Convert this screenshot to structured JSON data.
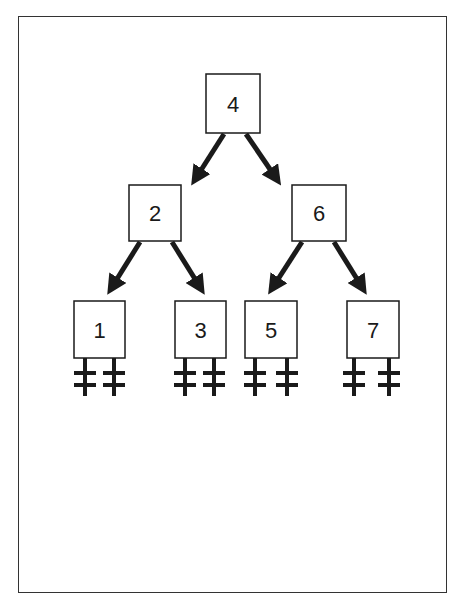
{
  "diagram": {
    "type": "binary-search-tree",
    "nodes": [
      {
        "id": "n4",
        "label": "4",
        "x": 206,
        "y": 74,
        "w": 54,
        "h": 59
      },
      {
        "id": "n2",
        "label": "2",
        "x": 129,
        "y": 185,
        "w": 52,
        "h": 56
      },
      {
        "id": "n6",
        "label": "6",
        "x": 292,
        "y": 185,
        "w": 54,
        "h": 56
      },
      {
        "id": "n1",
        "label": "1",
        "x": 74,
        "y": 301,
        "w": 51,
        "h": 57
      },
      {
        "id": "n3",
        "label": "3",
        "x": 175,
        "y": 301,
        "w": 51,
        "h": 57
      },
      {
        "id": "n5",
        "label": "5",
        "x": 245,
        "y": 301,
        "w": 52,
        "h": 57
      },
      {
        "id": "n7",
        "label": "7",
        "x": 347,
        "y": 301,
        "w": 52,
        "h": 57
      }
    ],
    "edges": [
      {
        "from": "4",
        "to": "2",
        "x1": 224,
        "y1": 134,
        "x2": 196,
        "y2": 178
      },
      {
        "from": "4",
        "to": "6",
        "x1": 246,
        "y1": 134,
        "x2": 276,
        "y2": 178
      },
      {
        "from": "2",
        "to": "1",
        "x1": 140,
        "y1": 242,
        "x2": 112,
        "y2": 287
      },
      {
        "from": "2",
        "to": "3",
        "x1": 172,
        "y1": 242,
        "x2": 200,
        "y2": 287
      },
      {
        "from": "6",
        "to": "5",
        "x1": 302,
        "y1": 242,
        "x2": 273,
        "y2": 287
      },
      {
        "from": "6",
        "to": "7",
        "x1": 334,
        "y1": 242,
        "x2": 362,
        "y2": 287
      }
    ],
    "null_pointers": [
      {
        "node": "1",
        "x": 85
      },
      {
        "node": "1",
        "x": 114
      },
      {
        "node": "3",
        "x": 185
      },
      {
        "node": "3",
        "x": 214
      },
      {
        "node": "5",
        "x": 255
      },
      {
        "node": "5",
        "x": 287
      },
      {
        "node": "7",
        "x": 354
      },
      {
        "node": "7",
        "x": 389
      }
    ],
    "colors": {
      "stroke": "#1a1a1a",
      "fill": "#ffffff",
      "frame": "#333333"
    }
  }
}
